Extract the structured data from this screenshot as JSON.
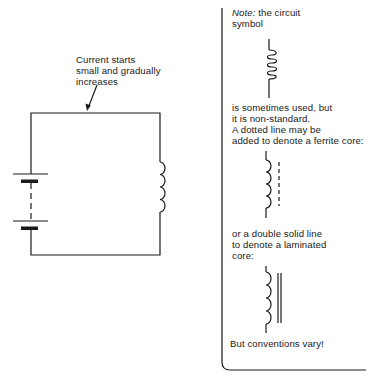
{
  "circuit": {
    "annotation": [
      "Current starts",
      "small and gradually",
      "increases"
    ],
    "components": [
      "battery",
      "inductor"
    ]
  },
  "note": {
    "label": "Note:",
    "intro": "the circuit",
    "intro2": "symbol",
    "para1": [
      "is sometimes used, but",
      "it is non-standard.",
      "A dotted line may be",
      "added to denote a ferrite core:"
    ],
    "para2": [
      "or a double solid line",
      "to denote a laminated",
      "core:"
    ],
    "closing": "But conventions vary!"
  },
  "colors": {
    "ink": "#1a1a1a",
    "background": "#ffffff"
  }
}
